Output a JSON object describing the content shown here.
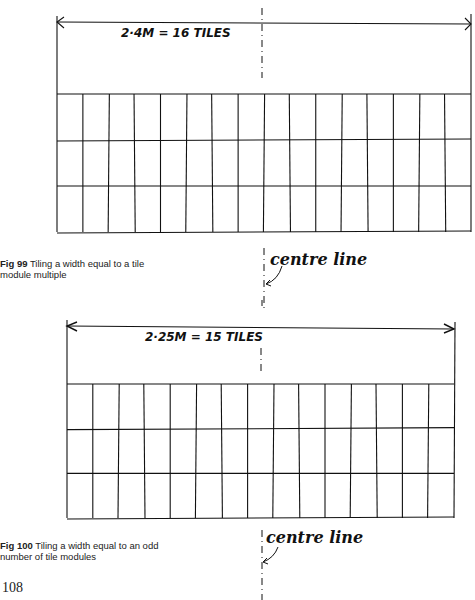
{
  "page_number": "108",
  "figures": [
    {
      "id": "fig99",
      "dimension_label": "2·4M = 16 TILES",
      "tiles_across": 16,
      "tile_rows": 3,
      "caption_bold": "Fig 99",
      "caption_text": " Tiling a width equal to a tile module multiple",
      "centre_label": "centre line"
    },
    {
      "id": "fig100",
      "dimension_label": "2·25M = 15 TILES",
      "tiles_across": 15,
      "tile_rows": 3,
      "caption_bold": "Fig 100",
      "caption_text": " Tiling a width equal to an odd number of tile modules",
      "centre_label": "centre line"
    }
  ],
  "colors": {
    "ink": "#111111",
    "paper": "#ffffff"
  }
}
